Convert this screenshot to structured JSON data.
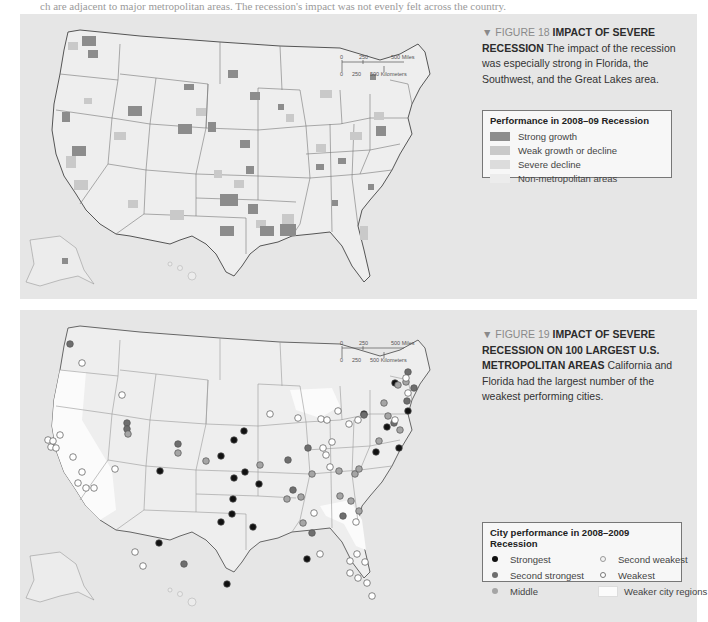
{
  "page_top_text": "ch are adjacent to major metropolitan areas. The recession's impact was not evenly felt across the country.",
  "figure18": {
    "label": "▼ FIGURE 18",
    "title": "IMPACT OF SEVERE RECESSION",
    "description": "The impact of the recession was especially strong in Florida, the Southwest, and the Great Lakes area.",
    "scale": {
      "miles": [
        "0",
        "250",
        "500 Miles"
      ],
      "km": [
        "0",
        "250",
        "500 Kilometers"
      ]
    },
    "legend": {
      "title": "Performance in 2008–09 Recession",
      "items": [
        {
          "label": "Strong growth",
          "color": "#8c8c8c"
        },
        {
          "label": "Weak growth or decline",
          "color": "#c9c9c9"
        },
        {
          "label": "Severe decline",
          "color": "#dcdcdc"
        },
        {
          "label": "Non-metropolitan areas",
          "color": "#ececec"
        }
      ]
    }
  },
  "figure19": {
    "label": "▼ FIGURE 19",
    "title": "IMPACT OF SEVERE RECESSION ON 100 LARGEST U.S. METROPOLITAN AREAS",
    "description": "California and Florida had the largest number of the weakest performing cities.",
    "scale": {
      "miles": [
        "0",
        "250",
        "500 Miles"
      ],
      "km": [
        "0",
        "250",
        "500 Kilometers"
      ]
    },
    "legend": {
      "title": "City performance in 2008–2009 Recession",
      "items": [
        {
          "label": "Strongest",
          "symbol": "dot-black",
          "color": "#111111"
        },
        {
          "label": "Second weakest",
          "symbol": "dot-white-light",
          "color": "#f4f4f4"
        },
        {
          "label": "Second strongest",
          "symbol": "dot-dark-gray",
          "color": "#6e6e6e"
        },
        {
          "label": "Weakest",
          "symbol": "dot-white",
          "color": "#ffffff"
        },
        {
          "label": "Middle",
          "symbol": "dot-gray",
          "color": "#a0a0a0"
        },
        {
          "label": "Weaker city regions",
          "symbol": "area-white",
          "color": "#fbfbfb"
        }
      ]
    }
  },
  "colors": {
    "panel_bg": "#e6e6e6",
    "land": "#eeeeee",
    "border": "#555555",
    "strong": "#8c8c8c",
    "weak": "#c9c9c9"
  }
}
